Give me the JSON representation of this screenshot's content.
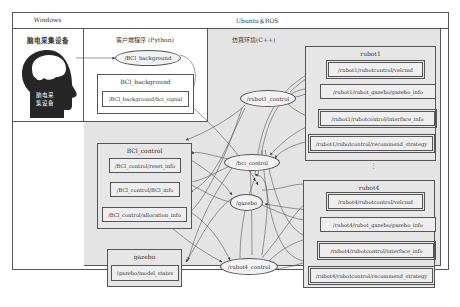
{
  "header": {
    "windows_label": "Windows",
    "ubuntu_label": "Ubuntu＆ROS"
  },
  "windows_section": {
    "title": "脑电采集设备",
    "head_icon_text_line1": "脑电采",
    "head_icon_text_line2": "集设备"
  },
  "client_section": {
    "title": "客户端程序 (Python)",
    "node_bci_background": "/BCl_background",
    "group_bci_background": {
      "title": "BCl_background",
      "topics": [
        "/BCl_background/bci_signal"
      ]
    }
  },
  "sim_section": {
    "title": "仿真环境(C++)",
    "nodes": {
      "rubot1_control": "/rubot1_control",
      "bci_control": "/bci_control",
      "gazebo": "/gazebo",
      "rubot4_control": "/rubot4_control"
    },
    "ellipsis": "⋮"
  },
  "groups": {
    "bci_control": {
      "title": "BCl_control",
      "topics": [
        "/BCl_control/reset_info",
        "/BCl_control/BCl_info",
        "/BCl_control/allocation_info"
      ]
    },
    "gazebo": {
      "title": "gazebo",
      "topics": [
        "/gazebo/model_states"
      ]
    },
    "rubot1": {
      "title": "rubot1",
      "topics": [
        "/rubot1/rubotcontrol/velcmd",
        "/rubot1/rubot_gazebo/gazebo_info",
        "/rubot1/rubotcontrol/interface_info",
        "/rubot1/rubotcontrol/recommend_strategy"
      ]
    },
    "rubot4": {
      "title": "rubot4",
      "topics": [
        "/rubot4/rubotcontrol/velcmd",
        "/rubot4/rubot_gazebo/gazebo_info",
        "/rubot4/rubotcontrol/interface_info",
        "/rubot4/rubotcontrol/recommend_strategy"
      ]
    }
  },
  "colors": {
    "line": "#555555",
    "sim_bg": "#e4e4e4",
    "head": "#262626"
  }
}
